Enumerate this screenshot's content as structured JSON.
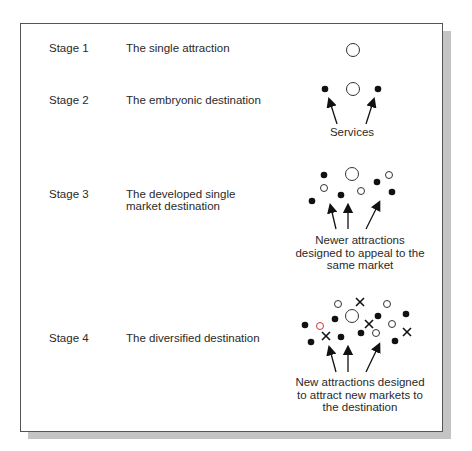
{
  "stages": [
    {
      "label": "Stage 1",
      "description": "The single attraction",
      "caption": ""
    },
    {
      "label": "Stage 2",
      "description": "The embryonic destination",
      "caption": "Services"
    },
    {
      "label": "Stage 3",
      "description": "The developed single market destination",
      "description_lines": [
        "The developed single",
        "market destination"
      ],
      "caption_lines": [
        "Newer attractions",
        "designed to appeal to the",
        "same market"
      ]
    },
    {
      "label": "Stage 4",
      "description": "The diversified destination",
      "caption_lines": [
        "New attractions designed",
        "to attract new markets to",
        "the destination"
      ]
    }
  ],
  "legend_symbols": {
    "large_open_circle": "original attraction",
    "filled_dot": "services",
    "small_open_circle": "newer attractions (same market)",
    "cross": "new attractions (new markets)"
  }
}
